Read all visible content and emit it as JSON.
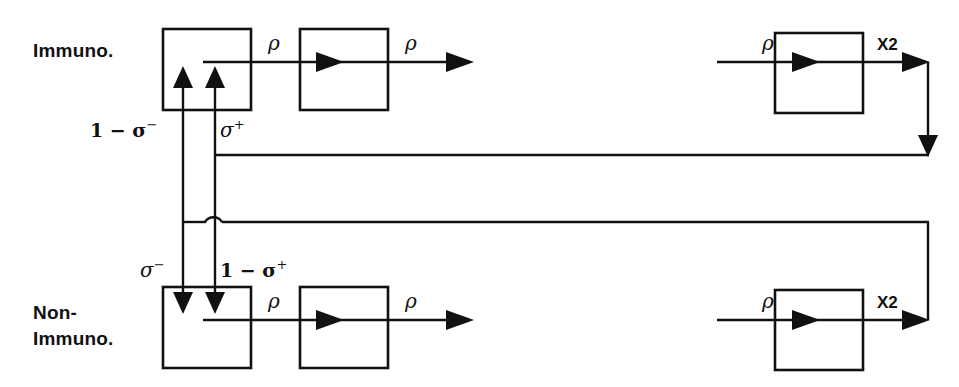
{
  "diagram": {
    "background_color": "#ffffff",
    "line_color": "#111111",
    "width": 959,
    "height": 387,
    "row_labels": {
      "top": "Immuno.",
      "bottom_line1": "Non-",
      "bottom_line2": "Immuno."
    },
    "flow_labels": {
      "rho": "ρ",
      "x2": "X2"
    },
    "transition_labels": {
      "top_left": "1 − σ",
      "top_left_sup": "−",
      "top_right": "σ",
      "top_right_sup": "+",
      "bottom_left": "σ",
      "bottom_left_sup": "−",
      "bottom_right": "1 − σ",
      "bottom_right_sup": "+"
    },
    "rho_labels": {
      "top_box1_out": "ρ",
      "top_box2_in": "ρ",
      "top_box2_out": "ρ",
      "top_box3_in": "ρ",
      "bottom_box1_out": "ρ",
      "bottom_box2_in": "ρ",
      "bottom_box2_out": "ρ",
      "bottom_box3_in": "ρ"
    },
    "x2_labels": {
      "top_out": "X2",
      "bottom_out": "X2"
    },
    "boxes": [
      {
        "id": "immuno-stage-1",
        "x": 163,
        "y": 29,
        "w": 88,
        "h": 81
      },
      {
        "id": "immuno-stage-2",
        "x": 300,
        "y": 29,
        "w": 88,
        "h": 81
      },
      {
        "id": "immuno-stage-3",
        "x": 775,
        "y": 33,
        "w": 88,
        "h": 80
      },
      {
        "id": "nonimmuno-stage-1",
        "x": 163,
        "y": 287,
        "w": 88,
        "h": 81
      },
      {
        "id": "nonimmuno-stage-2",
        "x": 300,
        "y": 287,
        "w": 88,
        "h": 81
      },
      {
        "id": "nonimmuno-stage-3",
        "x": 775,
        "y": 290,
        "w": 88,
        "h": 80
      }
    ]
  }
}
